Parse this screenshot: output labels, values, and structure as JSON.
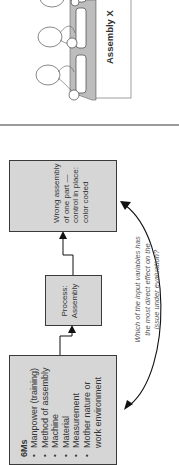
{
  "diagram": {
    "orientation": "rotated-90-ccw",
    "illustration": {
      "label": "Assembly X",
      "workers": 3,
      "parts": 3
    },
    "inputs_box": {
      "title": "6Ms",
      "items": [
        "Manpower (training)",
        "Method of assembly",
        "Machine",
        "Material",
        "Measurement",
        "Mother nature or",
        "work environment"
      ]
    },
    "process_box": {
      "line1": "Process:",
      "line2": "Assembly"
    },
    "output_box": {
      "lines": [
        "Wrong assembly",
        "of one part —",
        "control in place:",
        "color coded"
      ]
    },
    "question": {
      "lines": [
        "Which of the input variables has",
        "the most direct effect on the",
        "issue under evaluation?"
      ]
    },
    "colors": {
      "box_fill": "#d6d6d6",
      "box_border": "#3a3a3a",
      "divider": "#9a9a9a",
      "arrow": "#111111"
    }
  }
}
